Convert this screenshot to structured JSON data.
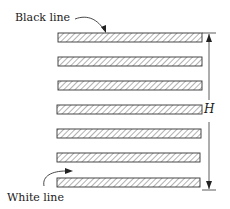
{
  "diagram": {
    "type": "grating-line-pattern",
    "labels": {
      "black_line": "Black line",
      "white_line": "White line",
      "height": "H"
    },
    "bar_count": 7,
    "bars": [
      {
        "x": 58,
        "y": 33,
        "w": 144,
        "h": 9
      },
      {
        "x": 58,
        "y": 57,
        "w": 144,
        "h": 9
      },
      {
        "x": 58,
        "y": 81,
        "w": 144,
        "h": 9
      },
      {
        "x": 57,
        "y": 105,
        "w": 145,
        "h": 9
      },
      {
        "x": 57,
        "y": 129,
        "w": 144,
        "h": 9
      },
      {
        "x": 57,
        "y": 153,
        "w": 143,
        "h": 9
      },
      {
        "x": 57,
        "y": 178,
        "w": 143,
        "h": 9
      }
    ],
    "dimension": {
      "x": 209,
      "top": 33,
      "bottom": 190
    },
    "colors": {
      "stroke": "#333333",
      "hatch": "#555555",
      "fill": "#ffffff",
      "text": "#1a1a1a"
    }
  }
}
